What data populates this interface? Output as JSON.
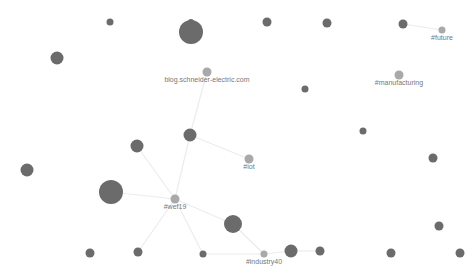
{
  "graph": {
    "title": "Hashtag network graph",
    "colors": {
      "node": "#6b6b6b",
      "tag_node": "#a9a9a9",
      "edge": "#ececec",
      "label": "#777777"
    },
    "nodes": [
      {
        "id": "n_top_big",
        "size": "large"
      },
      {
        "id": "n_top_dot",
        "size": "tiny"
      },
      {
        "id": "n_top_small1",
        "size": "small"
      },
      {
        "id": "n_left_top",
        "size": "medium"
      },
      {
        "id": "n_top_r1",
        "size": "small"
      },
      {
        "id": "n_top_r2",
        "size": "small"
      },
      {
        "id": "n_future_hub",
        "size": "small"
      },
      {
        "id": "future",
        "label": "#future",
        "size": "tiny",
        "tag": true
      },
      {
        "id": "manufacturing",
        "label": "#manufacturing",
        "size": "small",
        "tag": true
      },
      {
        "id": "blog",
        "label": "blog.schneider-electric.com",
        "size": "small",
        "tag": true
      },
      {
        "id": "n_mid_dot",
        "size": "tiny"
      },
      {
        "id": "n_hub",
        "size": "medium"
      },
      {
        "id": "n_left_mid",
        "size": "medium"
      },
      {
        "id": "iot",
        "label": "#iot",
        "size": "small",
        "tag": true
      },
      {
        "id": "n_right1",
        "size": "tiny"
      },
      {
        "id": "n_right2",
        "size": "small"
      },
      {
        "id": "n_far_left",
        "size": "medium"
      },
      {
        "id": "n_big_left",
        "size": "large"
      },
      {
        "id": "wef19",
        "label": "#wef19",
        "size": "small",
        "tag": true
      },
      {
        "id": "n_low_mid",
        "size": "medium-large"
      },
      {
        "id": "n_right3",
        "size": "small"
      },
      {
        "id": "n_bot1",
        "size": "small"
      },
      {
        "id": "n_bot2",
        "size": "small"
      },
      {
        "id": "n_bot3",
        "size": "tiny"
      },
      {
        "id": "industry40",
        "label": "#industry40",
        "size": "tiny",
        "tag": true
      },
      {
        "id": "n_bot4",
        "size": "medium"
      },
      {
        "id": "n_bot5",
        "size": "small"
      },
      {
        "id": "n_bot6",
        "size": "small"
      },
      {
        "id": "n_bot7",
        "size": "small"
      }
    ],
    "edges": [
      [
        "n_future_hub",
        "future"
      ],
      [
        "blog",
        "n_hub"
      ],
      [
        "n_hub",
        "iot"
      ],
      [
        "n_hub",
        "wef19"
      ],
      [
        "wef19",
        "n_left_mid"
      ],
      [
        "wef19",
        "n_big_left"
      ],
      [
        "wef19",
        "n_low_mid"
      ],
      [
        "wef19",
        "n_bot2"
      ],
      [
        "wef19",
        "n_bot3"
      ],
      [
        "n_low_mid",
        "industry40"
      ],
      [
        "n_bot3",
        "industry40"
      ],
      [
        "industry40",
        "n_bot4"
      ],
      [
        "n_bot4",
        "n_bot5"
      ]
    ]
  }
}
